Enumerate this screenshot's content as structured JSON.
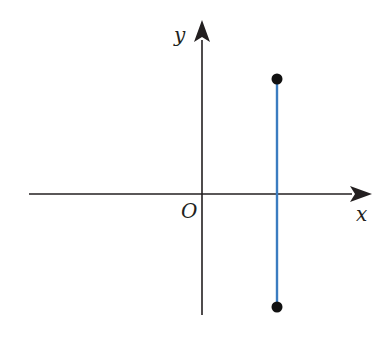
{
  "diagram": {
    "type": "coordinate-plane",
    "labels": {
      "x_axis": "x",
      "y_axis": "y",
      "origin": "O"
    },
    "colors": {
      "axis": "#231f20",
      "segment": "#3a7cc0",
      "point": "#111111"
    },
    "segment": {
      "orientation": "vertical",
      "position": "right of y-axis",
      "crosses_x_axis": true,
      "endpoints": [
        "top",
        "bottom"
      ],
      "endpoint_style": "filled-dot"
    }
  }
}
